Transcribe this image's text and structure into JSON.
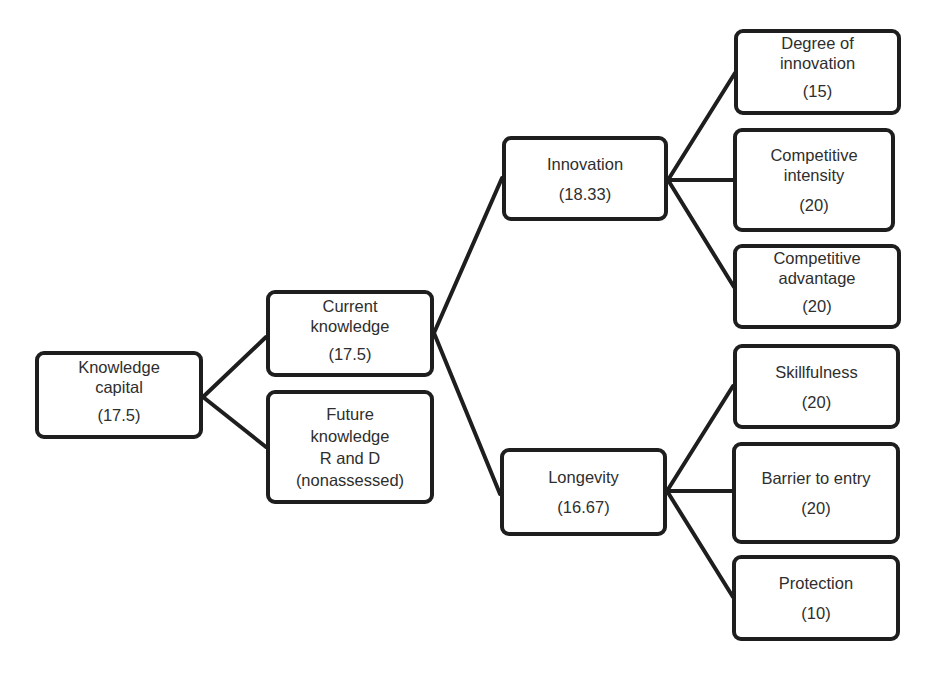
{
  "diagram": {
    "title": "",
    "background_color": "#ffffff",
    "line_color": "#1e1e1e",
    "nodes": {
      "knowledge_capital": {
        "label": "Knowledge\ncapital",
        "value": "(17.5)"
      },
      "current_knowledge": {
        "label": "Current\nknowledge",
        "value": "(17.5)"
      },
      "future_knowledge": {
        "label": "Future\nknowledge\nR and D\n(nonassessed)",
        "value": ""
      },
      "innovation": {
        "label": "Innovation",
        "value": "(18.33)"
      },
      "longevity": {
        "label": "Longevity",
        "value": "(16.67)"
      },
      "degree_of_innovation": {
        "label": "Degree of\ninnovation",
        "value": "(15)"
      },
      "competitive_intensity": {
        "label": "Competitive\nintensity",
        "value": "(20)"
      },
      "competitive_advantage": {
        "label": "Competitive\nadvantage",
        "value": "(20)"
      },
      "skillfulness": {
        "label": "Skillfulness",
        "value": "(20)"
      },
      "barrier_to_entry": {
        "label": "Barrier to entry",
        "value": "(20)"
      },
      "protection": {
        "label": "Protection",
        "value": "(10)"
      }
    },
    "edges": [
      {
        "from": "knowledge_capital",
        "to": "current_knowledge"
      },
      {
        "from": "knowledge_capital",
        "to": "future_knowledge"
      },
      {
        "from": "current_knowledge",
        "to": "innovation"
      },
      {
        "from": "current_knowledge",
        "to": "longevity"
      },
      {
        "from": "innovation",
        "to": "degree_of_innovation"
      },
      {
        "from": "innovation",
        "to": "competitive_intensity"
      },
      {
        "from": "innovation",
        "to": "competitive_advantage"
      },
      {
        "from": "longevity",
        "to": "skillfulness"
      },
      {
        "from": "longevity",
        "to": "barrier_to_entry"
      },
      {
        "from": "longevity",
        "to": "protection"
      }
    ]
  }
}
